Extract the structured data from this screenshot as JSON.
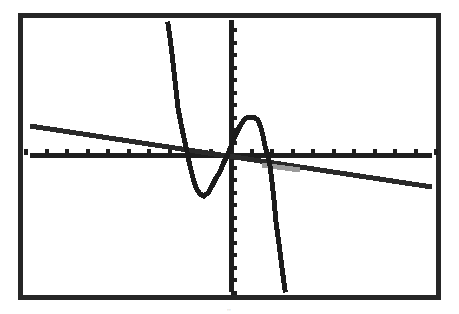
{
  "chart_data": {
    "type": "line",
    "title": "",
    "xlabel": "",
    "ylabel": "",
    "grid": false,
    "legend": null,
    "source": "graphing calculator screen (TI-style), pixelated rendering",
    "frame": {
      "x": 20,
      "y": 15,
      "width": 418,
      "height": 282,
      "color": "#262626"
    },
    "axes": {
      "origin_px": [
        231,
        155
      ],
      "x_tick_spacing_px": 20.5,
      "y_tick_spacing_px": 12.5,
      "x_ticks_left": 10,
      "x_ticks_right": 10,
      "y_ticks_up": 10,
      "y_ticks_down": 11,
      "ylim_px": [
        20,
        292
      ],
      "xlim_px": [
        30,
        432
      ]
    },
    "series": [
      {
        "name": "cubic",
        "description": "cubic with three real roots, falling steeply from top-left, local min below x-axis, local max above, then falling steeply",
        "color": "#1c1c1c",
        "points_px": [
          [
            168,
            24
          ],
          [
            170,
            38
          ],
          [
            172,
            54
          ],
          [
            174,
            72
          ],
          [
            176,
            90
          ],
          [
            178,
            108
          ],
          [
            181,
            124
          ],
          [
            184,
            138
          ],
          [
            187,
            152
          ],
          [
            190,
            166
          ],
          [
            193,
            178
          ],
          [
            196,
            188
          ],
          [
            200,
            194
          ],
          [
            204,
            196
          ],
          [
            208,
            193
          ],
          [
            212,
            186
          ],
          [
            216,
            178
          ],
          [
            220,
            172
          ],
          [
            224,
            162
          ],
          [
            228,
            154
          ],
          [
            232,
            144
          ],
          [
            236,
            134
          ],
          [
            240,
            126
          ],
          [
            244,
            120
          ],
          [
            248,
            117
          ],
          [
            254,
            117
          ],
          [
            258,
            120
          ],
          [
            261,
            128
          ],
          [
            263,
            136
          ],
          [
            265,
            146
          ],
          [
            268,
            156
          ],
          [
            270,
            166
          ],
          [
            272,
            182
          ],
          [
            274,
            200
          ],
          [
            276,
            222
          ],
          [
            279,
            244
          ],
          [
            282,
            268
          ],
          [
            285,
            290
          ]
        ]
      },
      {
        "name": "line",
        "description": "gently decreasing straight line crossing the axes near origin",
        "color": "#2a2a2a",
        "points_px": [
          [
            30,
            126
          ],
          [
            432,
            187
          ]
        ],
        "faded_segment_px": [
          [
            262,
            165
          ],
          [
            300,
            170
          ]
        ]
      }
    ]
  },
  "screen": {
    "caption_mark": "··"
  }
}
